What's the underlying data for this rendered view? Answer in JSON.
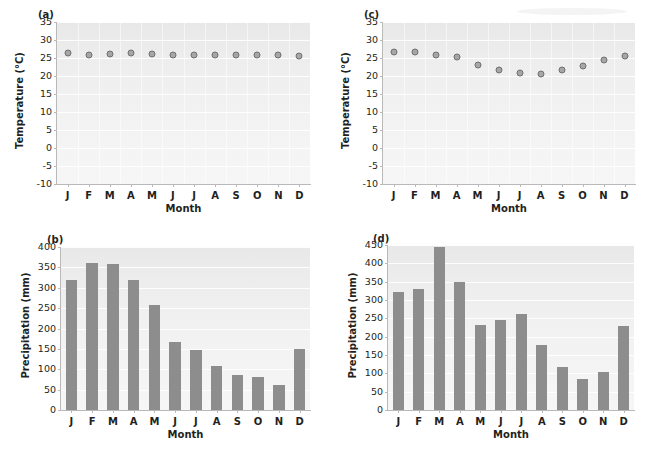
{
  "figure": {
    "months": [
      "J",
      "F",
      "M",
      "A",
      "M",
      "J",
      "J",
      "A",
      "S",
      "O",
      "N",
      "D"
    ],
    "axis_title_x": "Month",
    "axis_title_temperature": "Temperature (°C)",
    "axis_title_precipitation": "Precipitation (mm)",
    "marker_color": "#a6a6a6",
    "marker_edge_color": "#6f6f6f",
    "bar_color": "#8d8d8d",
    "plot_background": "#ededed",
    "gridline_color": "#ffffff"
  },
  "panels": {
    "a": {
      "tag": "(a)"
    },
    "b": {
      "tag": "(b)"
    },
    "c": {
      "tag": "(c)"
    },
    "d": {
      "tag": "(d)"
    }
  },
  "chart_data": [
    {
      "type": "scatter",
      "panel": "(a)",
      "title": "",
      "xlabel": "Month",
      "ylabel": "Temperature (°C)",
      "categories": [
        "J",
        "F",
        "M",
        "A",
        "M",
        "J",
        "J",
        "A",
        "S",
        "O",
        "N",
        "D"
      ],
      "values": [
        26.3,
        25.7,
        26.2,
        26.3,
        26.0,
        25.9,
        25.9,
        25.9,
        25.8,
        25.7,
        25.7,
        25.6
      ],
      "ylim": [
        -10,
        35
      ],
      "yticks": [
        -10,
        -5,
        0,
        5,
        10,
        15,
        20,
        25,
        30,
        35
      ],
      "grid": true,
      "legend": "none"
    },
    {
      "type": "bar",
      "panel": "(b)",
      "title": "",
      "xlabel": "Month",
      "ylabel": "Precipitation (mm)",
      "categories": [
        "J",
        "F",
        "M",
        "A",
        "M",
        "J",
        "J",
        "A",
        "S",
        "O",
        "N",
        "D"
      ],
      "values": [
        320,
        360,
        359,
        319,
        257,
        168,
        148,
        109,
        87,
        80,
        61,
        150
      ],
      "ylim": [
        0,
        400
      ],
      "yticks": [
        0,
        50,
        100,
        150,
        200,
        250,
        300,
        350,
        400
      ],
      "grid": true,
      "legend": "none"
    },
    {
      "type": "scatter",
      "panel": "(c)",
      "title": "",
      "xlabel": "Month",
      "ylabel": "Temperature (°C)",
      "categories": [
        "J",
        "F",
        "M",
        "A",
        "M",
        "J",
        "J",
        "A",
        "S",
        "O",
        "N",
        "D"
      ],
      "values": [
        26.6,
        26.6,
        25.9,
        25.4,
        23.0,
        21.8,
        20.7,
        20.5,
        21.8,
        22.8,
        24.4,
        25.5
      ],
      "ylim": [
        -10,
        35
      ],
      "yticks": [
        -10,
        -5,
        0,
        5,
        10,
        15,
        20,
        25,
        30,
        35
      ],
      "grid": true,
      "legend": "none"
    },
    {
      "type": "bar",
      "panel": "(d)",
      "title": "",
      "xlabel": "Month",
      "ylabel": "Precipitation (mm)",
      "categories": [
        "J",
        "F",
        "M",
        "A",
        "M",
        "J",
        "J",
        "A",
        "S",
        "O",
        "N",
        "D"
      ],
      "values": [
        322,
        330,
        445,
        348,
        231,
        246,
        261,
        178,
        118,
        85,
        103,
        228
      ],
      "ylim": [
        0,
        450
      ],
      "yticks": [
        0,
        50,
        100,
        150,
        200,
        250,
        300,
        350,
        400,
        450
      ],
      "grid": true,
      "legend": "none"
    }
  ]
}
